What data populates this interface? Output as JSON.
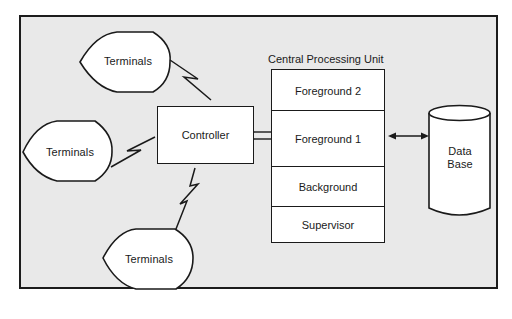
{
  "diagram": {
    "type": "system architecture block diagram",
    "colors": {
      "background": "#e9e9e9",
      "box_fill": "#ffffff",
      "stroke": "#1a1a1a"
    },
    "terminals": [
      {
        "label": "Terminals",
        "position": "top"
      },
      {
        "label": "Terminals",
        "position": "left"
      },
      {
        "label": "Terminals",
        "position": "bottom"
      }
    ],
    "controller": {
      "label": "Controller"
    },
    "cpu": {
      "title": "Central Processing Unit",
      "sections": [
        {
          "label": "Foreground 2"
        },
        {
          "label": "Foreground 1"
        },
        {
          "label": "Background"
        },
        {
          "label": "Supervisor"
        }
      ]
    },
    "database": {
      "line1": "Data",
      "line2": "Base"
    },
    "connections": [
      {
        "from": "Terminals (top)",
        "to": "Controller",
        "style": "zigzag (communication line)"
      },
      {
        "from": "Terminals (left)",
        "to": "Controller",
        "style": "zigzag (communication line)"
      },
      {
        "from": "Terminals (bottom)",
        "to": "Controller",
        "style": "zigzag (communication line)"
      },
      {
        "from": "Controller",
        "to": "Foreground 1",
        "style": "double line"
      },
      {
        "from": "Foreground 1",
        "to": "Data Base",
        "style": "bidirectional arrow"
      }
    ]
  }
}
